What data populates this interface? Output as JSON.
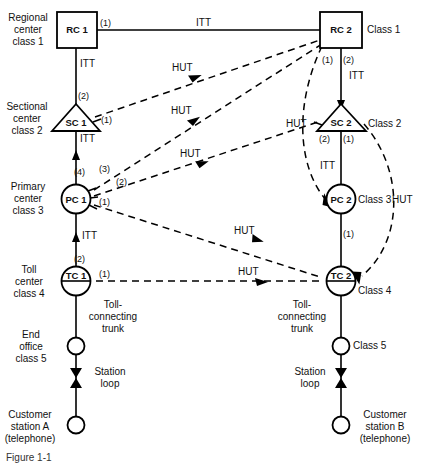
{
  "figure": {
    "type": "network-hierarchy-diagram",
    "caption_partial": "Figure 1-1",
    "link_types": {
      "ITT": "Intertoll trunk (solid line)",
      "HUT": "High-usage trunk (dashed line)"
    }
  },
  "side_labels": {
    "regional_center": "Regional\ncenter\nclass 1",
    "sectional_center": "Sectional\ncenter\nclass 2",
    "primary_center": "Primary\ncenter\nclass 3",
    "toll_center": "Toll\ncenter\nclass 4",
    "end_office": "End\noffice\nclass 5",
    "customer_a": "Customer\nstation A\n(telephone)",
    "customer_b": "Customer\nstation B\n(telephone)"
  },
  "nodes": {
    "rc1": {
      "label": "RC 1",
      "shape": "square"
    },
    "rc2": {
      "label": "RC 2",
      "shape": "square",
      "class_label": "Class 1"
    },
    "sc1": {
      "label": "SC 1",
      "shape": "triangle"
    },
    "sc2": {
      "label": "SC 2",
      "shape": "triangle",
      "class_label": "Class 2"
    },
    "pc1": {
      "label": "PC 1",
      "shape": "circle"
    },
    "pc2": {
      "label": "PC 2",
      "shape": "circle",
      "class_label": "Class 3"
    },
    "tc1": {
      "label": "TC 1",
      "shape": "half-circle"
    },
    "tc2": {
      "label": "TC 2",
      "shape": "half-circle",
      "class_label": "Class 4"
    },
    "eo_a": {
      "label": "",
      "shape": "circle-small"
    },
    "eo_b": {
      "label": "",
      "shape": "circle-small",
      "class_label": "Class 5"
    },
    "cs_a": {
      "label": "",
      "shape": "circle-small"
    },
    "cs_b": {
      "label": "",
      "shape": "circle-small"
    }
  },
  "trunk_labels": {
    "itt_top": "ITT",
    "itt_rc1_sc1": "ITT",
    "itt_sc1_pc1": "ITT",
    "itt_pc1_tc1": "ITT",
    "itt_rc2_sc2": "ITT",
    "itt_sc2_pc2": "ITT",
    "hut_1": "HUT",
    "hut_2": "HUT",
    "hut_3": "HUT",
    "hut_4": "HUT",
    "hut_right": "HUT"
  },
  "route_numbers": {
    "rc1_out": "(1)",
    "sc1_up": "(2)",
    "sc1_side": "(1)",
    "pc1_up": "(4)",
    "pc1_a": "(3)",
    "pc1_b": "(2)",
    "pc1_c": "(1)",
    "tc1_up": "(2)",
    "tc1_side": "(1)",
    "rc2_a": "(1)",
    "rc2_b": "(2)",
    "sc2_a": "(2)",
    "sc2_b": "(1)",
    "pc2_down": "(1)"
  },
  "local_plant": {
    "toll_connecting_trunk_left": "Toll-\nconnecting\ntrunk",
    "toll_connecting_trunk_right": "Toll-\nconnecting\ntrunk",
    "station_loop_left": "Station\nloop",
    "station_loop_right": "Station\nloop"
  }
}
